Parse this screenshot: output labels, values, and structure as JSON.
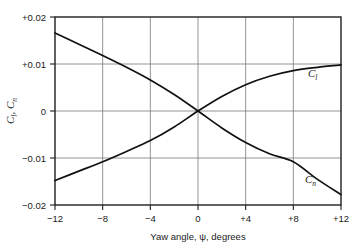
{
  "chart_data": {
    "type": "line",
    "title": "",
    "xlabel": "Yaw angle, ψ, degrees",
    "ylabel": "Cₗ, Cₙ",
    "xlim": [
      -12,
      12
    ],
    "ylim": [
      -0.02,
      0.02
    ],
    "grid": true,
    "legend": "inline-curve-labels",
    "xticks": [
      -12,
      -8,
      -4,
      0,
      4,
      8,
      12
    ],
    "xticklabels": [
      "−12",
      "−8",
      "−4",
      "0",
      "+4",
      "+8",
      "+12"
    ],
    "yticks": [
      0.02,
      0.01,
      0,
      -0.01,
      -0.02
    ],
    "yticklabels": [
      "+0.02",
      "+0.01",
      "0",
      "−0.01",
      "−0.02"
    ],
    "x": [
      -12,
      -10,
      -8,
      -6,
      -4,
      -2,
      0,
      2,
      4,
      6,
      8,
      10,
      12
    ],
    "series": [
      {
        "name": "C_l",
        "label": "C",
        "sublabel": "l",
        "description": "Rolling moment coefficient, increases with yaw angle",
        "values": [
          -0.0148,
          -0.0128,
          -0.0108,
          -0.0086,
          -0.0063,
          -0.0034,
          0.0,
          0.0031,
          0.0056,
          0.0074,
          0.0086,
          0.0093,
          0.0098
        ]
      },
      {
        "name": "C_n",
        "label": "C",
        "sublabel": "n",
        "description": "Yawing moment coefficient, decreases with yaw angle",
        "values": [
          0.0166,
          0.0142,
          0.0118,
          0.0093,
          0.0066,
          0.0035,
          0.0,
          -0.0036,
          -0.0067,
          -0.0091,
          -0.0108,
          -0.0145,
          -0.0178
        ]
      }
    ]
  },
  "axes": {
    "xlabel": "Yaw angle, ψ, degrees",
    "ylabel_part1": "C",
    "ylabel_sub1": "l",
    "ylabel_sep": ", ",
    "ylabel_part2": "C",
    "ylabel_sub2": "n"
  },
  "curve_labels": {
    "cl_main": "C",
    "cl_sub": "l",
    "cn_main": "C",
    "cn_sub": "n"
  },
  "colors": {
    "background": "#ffffff",
    "frame": "#1f1f1f",
    "gridline": "#7a7a7a",
    "curve": "#111111",
    "text": "#1a1a1a"
  }
}
